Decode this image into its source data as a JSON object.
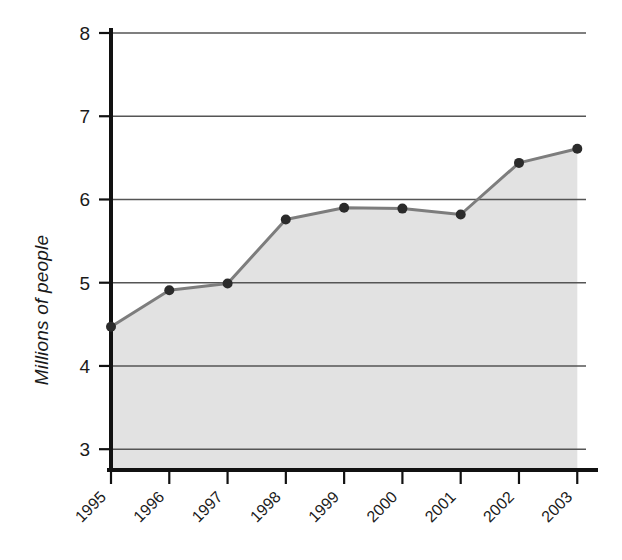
{
  "chart_data": {
    "type": "area",
    "title": "",
    "subtitle": "",
    "xlabel": "",
    "ylabel": "Millions of people",
    "categories": [
      "1995",
      "1996",
      "1997",
      "1998",
      "1999",
      "2000",
      "2001",
      "2002",
      "2003"
    ],
    "values": [
      4.47,
      4.91,
      4.99,
      5.76,
      5.9,
      5.89,
      5.82,
      6.44,
      6.61
    ],
    "series": [
      {
        "name": "Millions of people",
        "values": [
          4.47,
          4.91,
          4.99,
          5.76,
          5.9,
          5.89,
          5.82,
          6.44,
          6.61
        ]
      }
    ],
    "ylim": [
      2.75,
      8
    ],
    "yticks": [
      3,
      4,
      5,
      6,
      7,
      8
    ],
    "ytick_labels": [
      "3",
      "4",
      "5",
      "6",
      "7",
      "8"
    ],
    "xtick_labels": [
      "1995",
      "1996",
      "1997",
      "1998",
      "1999",
      "2000",
      "2001",
      "2002",
      "2003"
    ],
    "xtick_rotation": 45,
    "grid": true,
    "grid_axis": "y",
    "legend": false,
    "legend_position": "none",
    "markers": true,
    "marker_shape": "circle",
    "fill": true,
    "colors": {
      "line": "#7d7d7d",
      "marker": "#2b2b2b",
      "fill": "#e2e2e2",
      "gridline": "#555555",
      "axis": "#111111",
      "text": "#1a1a1a",
      "background": "#ffffff"
    }
  }
}
